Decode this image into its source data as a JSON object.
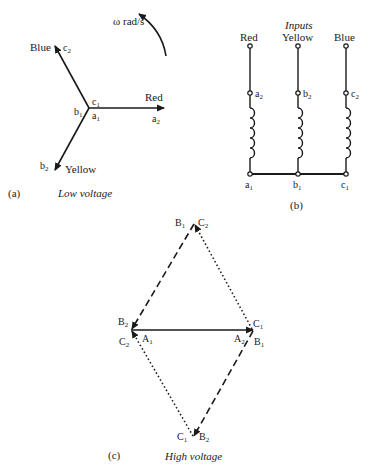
{
  "panel_a": {
    "tag": "(a)",
    "caption": "Low voltage",
    "rotation_label": "ω rad/s",
    "phases": [
      {
        "name": "Red",
        "end": "a2",
        "start": "a1"
      },
      {
        "name": "Blue",
        "end": "c2",
        "start": "c1"
      },
      {
        "name": "Yellow",
        "end": "b2",
        "start": "b1"
      }
    ],
    "labels": {
      "red": "Red",
      "blue": "Blue",
      "yellow": "Yellow",
      "a": "a",
      "b": "b",
      "c": "c",
      "s1": "1",
      "s2": "2"
    }
  },
  "panel_b": {
    "tag": "(b)",
    "title": "Inputs",
    "inputs": [
      "Red",
      "Yellow",
      "Blue"
    ],
    "top_terminals": [
      "a2",
      "b2",
      "c2"
    ],
    "bottom_terminals": [
      "a1",
      "b1",
      "c1"
    ],
    "labels": {
      "a": "a",
      "b": "b",
      "c": "c",
      "s1": "1",
      "s2": "2",
      "red": "Red",
      "yellow": "Yellow",
      "blue": "Blue"
    }
  },
  "panel_c": {
    "tag": "(c)",
    "caption": "High voltage",
    "labels": {
      "A": "A",
      "B": "B",
      "C": "C",
      "s1": "1",
      "s2": "2"
    }
  }
}
